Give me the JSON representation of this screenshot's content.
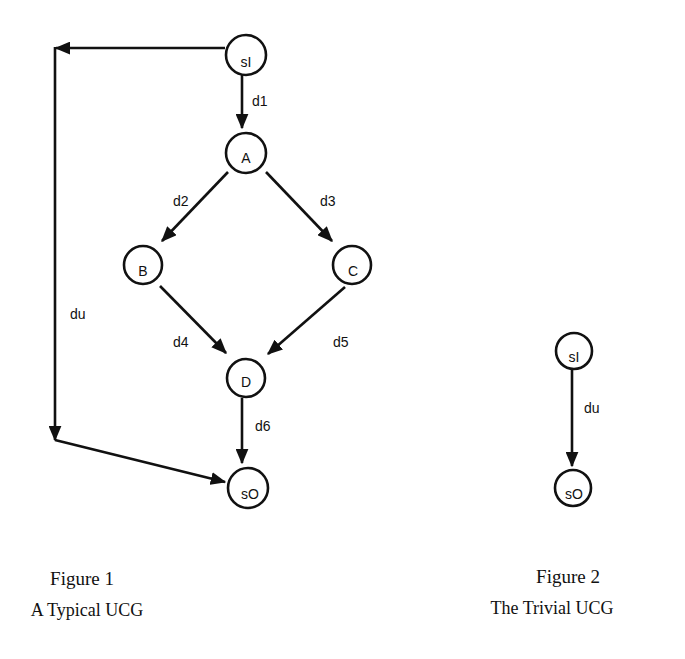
{
  "figure1": {
    "nodes": {
      "sI": "sI",
      "A": "A",
      "B": "B",
      "C": "C",
      "D": "D",
      "sO": "sO"
    },
    "edges": {
      "d1": "d1",
      "d2": "d2",
      "d3": "d3",
      "d4": "d4",
      "d5": "d5",
      "d6": "d6",
      "du": "du"
    },
    "caption": {
      "number": "Figure 1",
      "title": "A Typical UCG"
    }
  },
  "figure2": {
    "nodes": {
      "sI": "sI",
      "sO": "sO"
    },
    "edges": {
      "du": "du"
    },
    "caption": {
      "number": "Figure 2",
      "title": "The Trivial UCG"
    }
  },
  "colors": {
    "ink": "#111111",
    "background": "#ffffff"
  }
}
